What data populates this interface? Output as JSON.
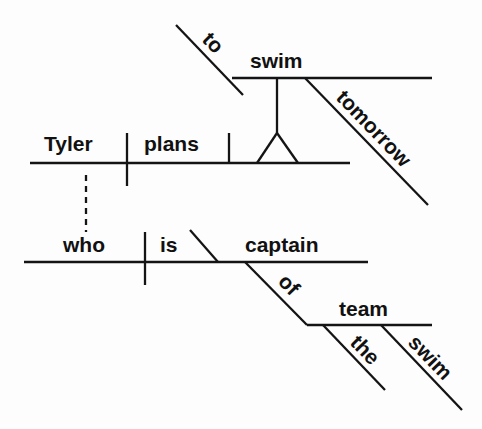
{
  "diagram": {
    "type": "Reed-Kellogg sentence diagram",
    "sentence_words": {
      "subject": "Tyler",
      "verb": "plans",
      "infinitive_marker": "to",
      "infinitive_verb": "swim",
      "infinitive_modifier": "tomorrow",
      "relative_pronoun": "who",
      "relative_verb": "is",
      "predicate_nominative": "captain",
      "preposition": "of",
      "object_of_preposition": "team",
      "article": "the",
      "noun_modifier": "swim"
    }
  }
}
